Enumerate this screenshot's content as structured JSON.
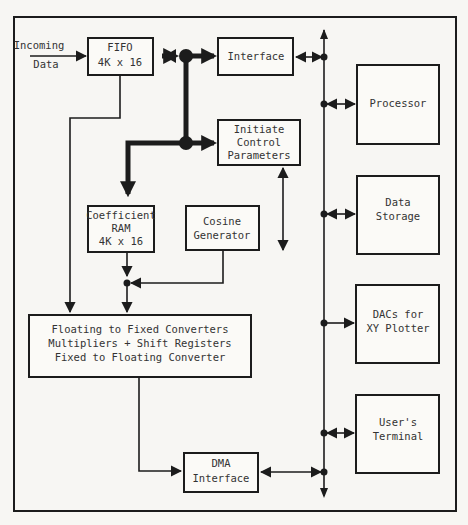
{
  "diagram": {
    "type": "block-diagram",
    "input_label": [
      "Incoming",
      "Data"
    ],
    "blocks": {
      "fifo": {
        "lines": [
          "FIFO",
          "4K x 16"
        ]
      },
      "interface": {
        "lines": [
          "Interface"
        ]
      },
      "initiate_control": {
        "lines": [
          "Initiate",
          "Control",
          "Parameters"
        ]
      },
      "coefficient_ram": {
        "lines": [
          "Coefficient",
          "RAM",
          "4K x 16"
        ]
      },
      "cosine_generator": {
        "lines": [
          "Cosine",
          "Generator"
        ]
      },
      "converters": {
        "lines": [
          "Floating to Fixed Converters",
          "Multipliers + Shift Registers",
          "Fixed to Floating Converter"
        ]
      },
      "dma_interface": {
        "lines": [
          "DMA",
          "Interface"
        ]
      },
      "processor": {
        "lines": [
          "Processor"
        ]
      },
      "data_storage": {
        "lines": [
          "Data",
          "Storage"
        ]
      },
      "dacs": {
        "lines": [
          "DACs for",
          "XY Plotter"
        ]
      },
      "users_terminal": {
        "lines": [
          "User's",
          "Terminal"
        ]
      }
    },
    "connections": [
      {
        "from": "Incoming Data",
        "to": "FIFO 4K x 16",
        "style": "thin"
      },
      {
        "from": "FIFO 4K x 16",
        "to": "Interface",
        "style": "thick-bidirectional"
      },
      {
        "from": "internal bus",
        "to": "Initiate Control Parameters",
        "style": "thick"
      },
      {
        "from": "internal bus",
        "to": "Coefficient RAM 4K x 16",
        "style": "thick"
      },
      {
        "from": "FIFO 4K x 16",
        "to": "Converters block",
        "style": "thin"
      },
      {
        "from": "Coefficient RAM 4K x 16",
        "to": "Converters block",
        "style": "thin"
      },
      {
        "from": "Cosine Generator",
        "to": "Coefficient RAM output junction",
        "style": "thin"
      },
      {
        "from": "Initiate Control Parameters",
        "to": "(open)",
        "style": "thin-bidirectional"
      },
      {
        "from": "Converters block",
        "to": "DMA Interface",
        "style": "thin"
      },
      {
        "from": "DMA Interface",
        "to": "system bus",
        "style": "thin-bidirectional"
      },
      {
        "from": "Interface",
        "to": "system bus",
        "style": "thin-bidirectional"
      },
      {
        "from": "system bus",
        "to": "Processor",
        "style": "thin-bidirectional"
      },
      {
        "from": "system bus",
        "to": "Data Storage",
        "style": "thin-bidirectional"
      },
      {
        "from": "system bus",
        "to": "DACs for XY Plotter",
        "style": "thin"
      },
      {
        "from": "system bus",
        "to": "User's Terminal",
        "style": "thin-bidirectional"
      }
    ]
  }
}
